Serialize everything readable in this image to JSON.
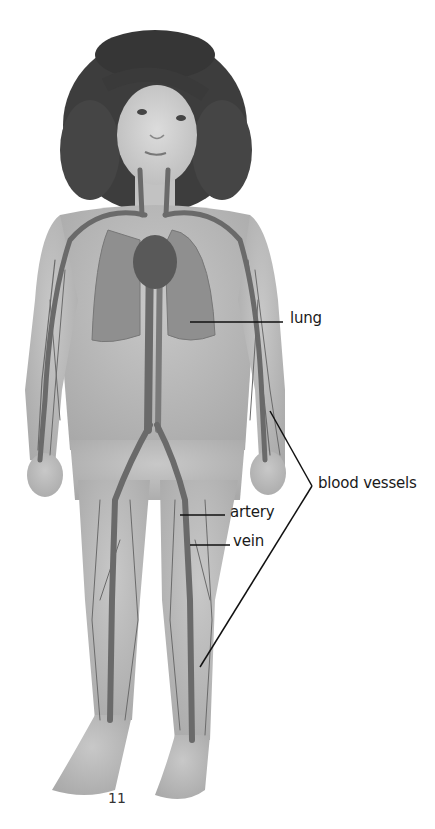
{
  "labels": {
    "lung": "lung",
    "blood_vessels": "blood vessels",
    "artery": "artery",
    "vein": "vein"
  },
  "page_number": "11",
  "colors": {
    "skin": "#b9b9b9",
    "hair": "#3a3a3a",
    "vessel": "#6a6a6a",
    "heart": "#595959",
    "lung": "#8e8e8e",
    "leader_line": "#111111"
  }
}
